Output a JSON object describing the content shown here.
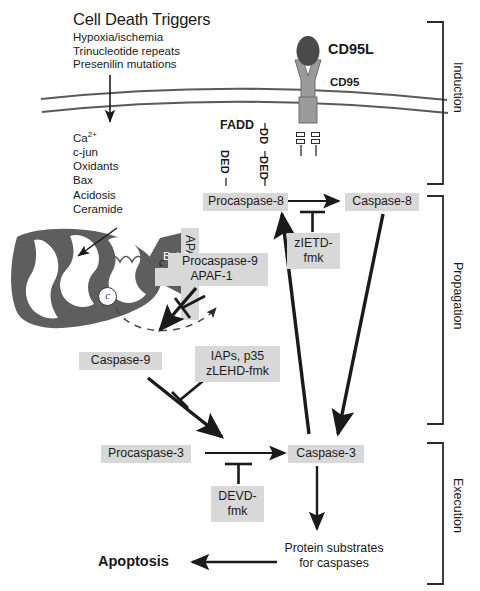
{
  "figure": {
    "title": "Cell Death Triggers",
    "type": "apoptosis-signaling-pathway-diagram"
  },
  "triggers": {
    "items": [
      "Hypoxia/ischemia",
      "Trinucleotide repeats",
      "Presenilin mutations"
    ]
  },
  "mediators": {
    "items": [
      "Ca2+",
      "c-jun",
      "Oxidants",
      "Bax",
      "Acidosis",
      "Ceramide"
    ],
    "calcium_base": "Ca",
    "calcium_sup": "2+"
  },
  "receptor": {
    "ligand_label": "CD95L",
    "receptor_label": "CD95",
    "adapter_label": "FADD",
    "death_domain_left": "DD",
    "death_domain_right": "DD",
    "fadd_dd": "DD",
    "fadd_ded": "DED",
    "procaspase8_ded": "DED"
  },
  "nodes": {
    "procaspase8": "Procaspase-8",
    "caspase8": "Caspase-8",
    "procaspase9_line1": "Procaspase-9",
    "procaspase9_line2": "APAF-1",
    "caspase9": "Caspase-9",
    "procaspase3": "Procaspase-3",
    "caspase3": "Caspase-3",
    "substrates_line1": "Protein substrates",
    "substrates_line2": "for caspases",
    "apoptosis": "Apoptosis",
    "bcl2": "Bcl-2",
    "apaf1": "APAF-1",
    "cytochrome_c": "c"
  },
  "inhibitors": {
    "zietd_line1": "zIETD-",
    "zietd_line2": "fmk",
    "iaps_line1": "IAPs, p35",
    "iaps_line2": "zLEHD-fmk",
    "devd_line1": "DEVD-",
    "devd_line2": "fmk"
  },
  "phases": {
    "induction": "Induction",
    "propagation": "Propagation",
    "execution": "Execution"
  },
  "colors": {
    "box_fill": "#d8d8d8",
    "mito_fill": "#5e5e5e",
    "receptor_fill": "#9a9a9a",
    "ligand_fill": "#4a4a4a",
    "stroke": "#2b2b2b",
    "membrane": "#5a5a5a",
    "background": "#ffffff"
  }
}
